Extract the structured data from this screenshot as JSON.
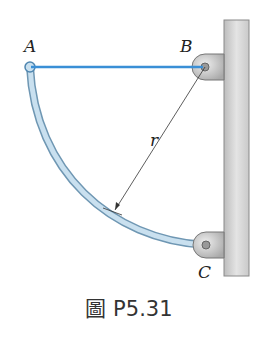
{
  "figure": {
    "caption": "圖 P5.31",
    "labels": {
      "A": "A",
      "B": "B",
      "C": "C",
      "r": "r"
    },
    "colors": {
      "cable": "#3a8fd6",
      "rod": "#b9d4e6",
      "rod_edge": "#6f97b3",
      "wall": "#d6d6d6",
      "wall_edge": "#8a8a8a",
      "bracket": "#c8c8c8"
    }
  }
}
